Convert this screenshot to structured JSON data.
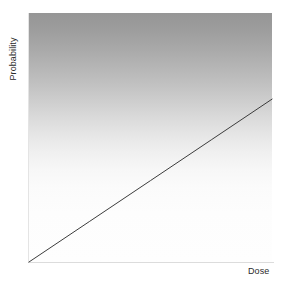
{
  "figure": {
    "background_color": "#ffffff",
    "width": 284,
    "height": 288
  },
  "chart_data": {
    "type": "line",
    "title": "",
    "subtitle": "",
    "xlabel": "Dose",
    "ylabel": "Probability",
    "xlim": [
      0,
      1
    ],
    "ylim": [
      0,
      1
    ],
    "grid": false,
    "legend": false,
    "legend_position": "none",
    "xticks": [],
    "yticks": [],
    "xticklabels": [],
    "yticklabels": [],
    "annotations": [],
    "series": [
      {
        "name": "Linear no-threshold dose-response",
        "type": "line",
        "color": "#3c3c3c",
        "linewidth": 1,
        "x": [
          0,
          0.25,
          0.5,
          0.75,
          1.0
        ],
        "values": [
          0,
          0.1635,
          0.327,
          0.4905,
          0.654
        ]
      }
    ],
    "panel": {
      "fill": "vertical-gradient",
      "fill_top_color": "#969696",
      "fill_bottom_color": "#fefefe",
      "border_color": "#e0e0e0"
    }
  },
  "labels": {
    "y_axis": "Probability",
    "x_axis": "Dose"
  },
  "colors": {
    "line": "#3c3c3c",
    "gradient_top": "#969696",
    "gradient_bottom": "#fefefe",
    "axis": "#dcdcdc",
    "text": "#2b2b2b",
    "background": "#ffffff"
  }
}
